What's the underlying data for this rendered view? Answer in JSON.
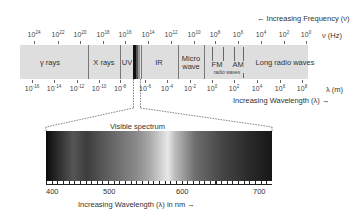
{
  "title_frequency": "← Increasing Frequency (ν)",
  "title_wavelength": "Increasing Wavelength (λ) →",
  "frequency_unit": "ν (Hz)",
  "wavelength_unit": "λ (m)",
  "frequency_ticks": [
    {
      "base": "10",
      "exp": "24"
    },
    {
      "base": "10",
      "exp": "22"
    },
    {
      "base": "10",
      "exp": "20"
    },
    {
      "base": "10",
      "exp": "18"
    },
    {
      "base": "10",
      "exp": "16"
    },
    {
      "base": "10",
      "exp": "14"
    },
    {
      "base": "10",
      "exp": "12"
    },
    {
      "base": "10",
      "exp": "10"
    },
    {
      "base": "10",
      "exp": "8"
    },
    {
      "base": "10",
      "exp": "6"
    },
    {
      "base": "10",
      "exp": "4"
    },
    {
      "base": "10",
      "exp": "2"
    },
    {
      "base": "10",
      "exp": "0"
    }
  ],
  "wavelength_ticks": [
    {
      "base": "10",
      "exp": "-16"
    },
    {
      "base": "10",
      "exp": "-14"
    },
    {
      "base": "10",
      "exp": "-12"
    },
    {
      "base": "10",
      "exp": "-10"
    },
    {
      "base": "10",
      "exp": "-8"
    },
    {
      "base": "10",
      "exp": "-6"
    },
    {
      "base": "10",
      "exp": "-4"
    },
    {
      "base": "10",
      "exp": "-2"
    },
    {
      "base": "10",
      "exp": "0"
    },
    {
      "base": "10",
      "exp": "2"
    },
    {
      "base": "10",
      "exp": "4"
    },
    {
      "base": "10",
      "exp": "6"
    },
    {
      "base": "10",
      "exp": "8"
    }
  ],
  "bands": {
    "gamma": "γ rays",
    "xray": "X rays",
    "uv": "UV",
    "ir": "IR",
    "micro_1": "Micro",
    "micro_2": "wave",
    "fm": "FM",
    "am": "AM",
    "radio": "radio waves",
    "long_radio": "Long radio waves"
  },
  "visible": {
    "title": "Visible spectrum",
    "ticks": [
      "400",
      "500",
      "600",
      "700"
    ],
    "caption": "Increasing Wavelength (λ) in nm →"
  },
  "colors": {
    "bar": "#dedede",
    "divider": "#777777",
    "text": "#333333"
  }
}
